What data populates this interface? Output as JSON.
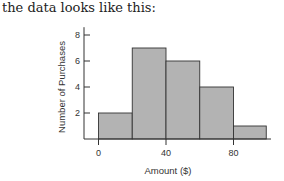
{
  "intro_text": "the data looks like this:",
  "chart_data": {
    "type": "bar",
    "subtype": "histogram",
    "title": "",
    "xlabel": "Amount ($)",
    "ylabel": "Number of Purchases",
    "bins": [
      {
        "start": 0,
        "end": 20,
        "count": 2
      },
      {
        "start": 20,
        "end": 40,
        "count": 7
      },
      {
        "start": 40,
        "end": 60,
        "count": 6
      },
      {
        "start": 60,
        "end": 80,
        "count": 4
      },
      {
        "start": 80,
        "end": 100,
        "count": 1
      }
    ],
    "categories": [
      "0-20",
      "20-40",
      "40-60",
      "60-80",
      "80-100"
    ],
    "values": [
      2,
      7,
      6,
      4,
      1
    ],
    "x_ticks": [
      0,
      40,
      80
    ],
    "y_ticks": [
      2,
      4,
      6,
      8
    ],
    "ylim": [
      0,
      8
    ],
    "xlim": [
      0,
      100
    ],
    "grid": false,
    "legend": null,
    "colors": {
      "bar_fill": "#b3b3b3",
      "bar_stroke": "#333333",
      "axis": "#333333"
    }
  }
}
